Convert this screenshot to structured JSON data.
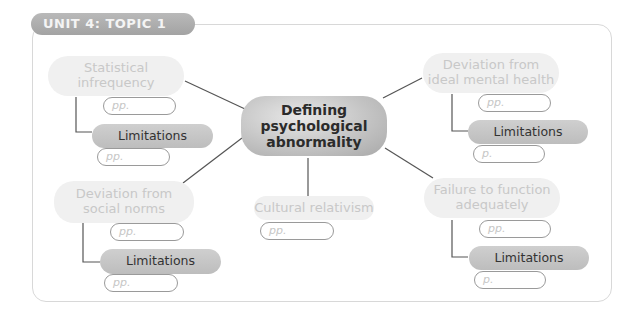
{
  "header": {
    "unit_tag": "UNIT 4: TOPIC 1"
  },
  "central_node": {
    "label": "Defining psychological abnormality"
  },
  "nodes": {
    "statistical_infrequency": {
      "label": "Statistical infrequency",
      "page_ref": "pp.",
      "limitations": {
        "label": "Limitations",
        "page_ref": "pp."
      }
    },
    "deviation_social_norms": {
      "label": "Deviation from social norms",
      "page_ref": "pp.",
      "limitations": {
        "label": "Limitations",
        "page_ref": "pp."
      }
    },
    "cultural_relativism": {
      "label": "Cultural relativism",
      "page_ref": "pp."
    },
    "deviation_ideal_mental_health": {
      "label": "Deviation from ideal mental health",
      "page_ref": "pp.",
      "limitations": {
        "label": "Limitations",
        "page_ref": "p."
      }
    },
    "failure_to_function": {
      "label": "Failure to function adequately",
      "page_ref": "pp.",
      "limitations": {
        "label": "Limitations",
        "page_ref": "p."
      }
    }
  },
  "colors": {
    "tag_bg": "#aaaaaa",
    "light_node_bg": "#f0f0f0",
    "light_node_text": "#c8c8c8",
    "limitations_bg": "#c6c6c6",
    "center_bg": "#bdbdbd",
    "line": "#555555",
    "frame": "#d8d8d8"
  }
}
